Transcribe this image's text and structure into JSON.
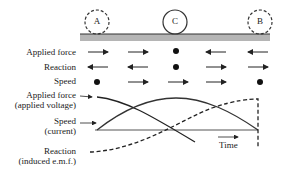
{
  "positions": {
    "A": "A",
    "C": "C",
    "B": "B"
  },
  "rows": [
    {
      "label": "Applied force",
      "symbols": [
        "arrow-right",
        "arrow-right",
        "dot",
        "arrow-left",
        "arrow-left"
      ]
    },
    {
      "label": "Reaction",
      "symbols": [
        "arrow-left",
        "arrow-left",
        "dot",
        "arrow-right",
        "arrow-right"
      ]
    },
    {
      "label": "Speed",
      "symbols": [
        "dot",
        "arrow-right",
        "arrow-right",
        "arrow-right",
        "dot"
      ]
    }
  ],
  "graph_labels": {
    "applied_force_line1": "Applied force",
    "applied_force_line2": "(applied voltage)",
    "speed_line1": "Speed",
    "speed_line2": "(current)",
    "reaction_line1": "Reaction",
    "reaction_line2": "(induced e.m.f.)",
    "time_axis": "Time"
  },
  "colors": {
    "rail": "#b5b5b5",
    "rail_top": "#333333",
    "ink": "#222222"
  }
}
